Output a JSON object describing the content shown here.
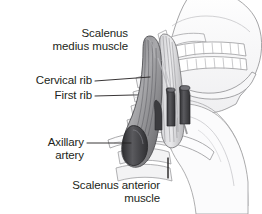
{
  "figure": {
    "style": "grayscale line-and-tone medical illustration",
    "background_color": "#ffffff",
    "text_color": "#231f20"
  },
  "labels": [
    {
      "id": "scalenus-medius",
      "line1": "Scalenus",
      "line2": "medius muscle",
      "align": "right",
      "x": 128,
      "y": 27,
      "leader": "M131,46 L166,46"
    },
    {
      "id": "cervical-rib",
      "line1": "Cervical rib",
      "line2": "",
      "align": "right",
      "x": 92,
      "y": 74,
      "leader": "M95,81 L150,77"
    },
    {
      "id": "first-rib",
      "line1": "First rib",
      "line2": "",
      "align": "right",
      "x": 92,
      "y": 89,
      "leader": "M95,96 L133,95"
    },
    {
      "id": "axillary-artery",
      "line1": "Axillary",
      "line2": "artery",
      "align": "right",
      "x": 84,
      "y": 136,
      "leader": "M87,143 L131,143"
    },
    {
      "id": "scalenus-anterior",
      "line1": "Scalenus anterior",
      "line2": "muscle",
      "align": "right",
      "x": 160,
      "y": 179,
      "leader": "M168,178 L168,158"
    }
  ],
  "anatomy": {
    "parts": [
      {
        "name": "skull-cranium",
        "tone": "#fbfbfc"
      },
      {
        "name": "mandible-jaw",
        "tone": "#fbfbfc"
      },
      {
        "name": "teeth-upper-row",
        "tone": "#ffffff"
      },
      {
        "name": "teeth-lower-row",
        "tone": "#ffffff"
      },
      {
        "name": "cervical-vertebrae",
        "tone": "#f4f4f5"
      },
      {
        "name": "cervical-rib",
        "tone": "#efeff0"
      },
      {
        "name": "first-rib",
        "tone": "#eeeeef"
      },
      {
        "name": "clavicle",
        "tone": "#f6f6f7"
      },
      {
        "name": "scapula-shoulder",
        "tone": "#f8f8f9"
      },
      {
        "name": "scalenus-medius-muscle",
        "tone": "#9a9a9c"
      },
      {
        "name": "scalenus-anterior-muscle",
        "tone": "#b4b4b6"
      },
      {
        "name": "axillary-artery",
        "tone": "#4a4a4c"
      },
      {
        "name": "subclavian-vessel",
        "tone": "#3f3f41"
      },
      {
        "name": "brachial-plexus-trunks",
        "tone": "#cfcfd1"
      }
    ],
    "outline_color": "#8e8e90",
    "dark_vessel_color": "#47474a",
    "muscle_color": "#8b8b8d"
  }
}
